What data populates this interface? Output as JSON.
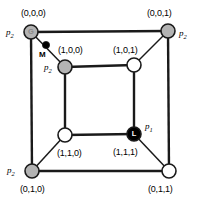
{
  "figure": {
    "background_color": "#ffffff",
    "edge_color": "#1a1a1a",
    "colors": {
      "node_gray": "#b3b3b3",
      "node_white": "#ffffff",
      "node_black": "#000000",
      "node_stroke": "#1a1a1a",
      "text": "#000000"
    }
  },
  "nodes": [
    {
      "id": "n000",
      "coord": "(0,0,0)",
      "fill": "gray",
      "cx": 31,
      "cy": 32,
      "r": 7,
      "glyph": "G",
      "glyph_tone": "light",
      "process": "p",
      "process_sub": "2",
      "coord_x": 21,
      "coord_y": 9,
      "process_x": 6,
      "process_y": 28
    },
    {
      "id": "n001",
      "coord": "(0,0,1)",
      "fill": "gray",
      "cx": 168,
      "cy": 31,
      "r": 7,
      "glyph": "",
      "glyph_tone": "light",
      "process": "p",
      "process_sub": "2",
      "coord_x": 147,
      "coord_y": 9,
      "process_x": 179,
      "process_y": 29
    },
    {
      "id": "n100",
      "coord": "(1,0,0)",
      "fill": "gray",
      "cx": 65,
      "cy": 67,
      "r": 7,
      "glyph": "",
      "glyph_tone": "light",
      "process": "p",
      "process_sub": "2",
      "coord_x": 58,
      "coord_y": 46,
      "process_x": 44,
      "process_y": 63
    },
    {
      "id": "n101",
      "coord": "(1,0,1)",
      "fill": "white",
      "cx": 134,
      "cy": 65,
      "r": 7,
      "glyph": "",
      "glyph_tone": "light",
      "process": "",
      "process_sub": "",
      "coord_x": 113,
      "coord_y": 46,
      "process_x": 0,
      "process_y": 0
    },
    {
      "id": "n110",
      "coord": "(1,1,0)",
      "fill": "white",
      "cx": 65,
      "cy": 135,
      "r": 7,
      "glyph": "",
      "glyph_tone": "light",
      "process": "",
      "process_sub": "",
      "coord_x": 57,
      "coord_y": 149,
      "process_x": 0,
      "process_y": 0
    },
    {
      "id": "n111",
      "coord": "(1,1,1)",
      "fill": "black",
      "cx": 134,
      "cy": 134,
      "r": 7,
      "glyph": "L",
      "glyph_tone": "dark",
      "process": "p",
      "process_sub": "1",
      "coord_x": 113,
      "coord_y": 148,
      "process_x": 145,
      "process_y": 122
    },
    {
      "id": "n010",
      "coord": "(0,1,0)",
      "fill": "gray",
      "cx": 32,
      "cy": 171,
      "r": 7,
      "glyph": "",
      "glyph_tone": "light",
      "process": "p",
      "process_sub": "2",
      "coord_x": 20,
      "coord_y": 185,
      "process_x": 7,
      "process_y": 166
    },
    {
      "id": "n011",
      "coord": "(0,1,1)",
      "fill": "white",
      "cx": 169,
      "cy": 171,
      "r": 7,
      "glyph": "",
      "glyph_tone": "light",
      "process": "",
      "process_sub": "",
      "coord_x": 148,
      "coord_y": 185,
      "process_x": 0,
      "process_y": 0
    }
  ],
  "edges": [
    {
      "id": "e-outer-top",
      "from": "n000",
      "to": "n001",
      "kind": "outer"
    },
    {
      "id": "e-outer-left",
      "from": "n000",
      "to": "n010",
      "kind": "outer"
    },
    {
      "id": "e-outer-right",
      "from": "n001",
      "to": "n011",
      "kind": "outer"
    },
    {
      "id": "e-outer-bottom",
      "from": "n010",
      "to": "n011",
      "kind": "outer"
    },
    {
      "id": "e-inner-top",
      "from": "n100",
      "to": "n101",
      "kind": "inner"
    },
    {
      "id": "e-inner-left",
      "from": "n100",
      "to": "n110",
      "kind": "inner"
    },
    {
      "id": "e-inner-right",
      "from": "n101",
      "to": "n111",
      "kind": "inner"
    },
    {
      "id": "e-inner-bottom",
      "from": "n110",
      "to": "n111",
      "kind": "inner"
    },
    {
      "id": "e-diag-tl",
      "from": "n000",
      "to": "n100",
      "kind": "diagonal"
    },
    {
      "id": "e-diag-tr",
      "from": "n001",
      "to": "n101",
      "kind": "diagonal"
    },
    {
      "id": "e-diag-bl",
      "from": "n010",
      "to": "n110",
      "kind": "diagonal"
    },
    {
      "id": "e-diag-br",
      "from": "n011",
      "to": "n111",
      "kind": "diagonal"
    }
  ],
  "markers": [
    {
      "id": "marker-m",
      "label": "M",
      "cx": 46,
      "cy": 45,
      "r": 3.6,
      "fill": "black",
      "label_x": 39,
      "label_y": 51
    }
  ]
}
